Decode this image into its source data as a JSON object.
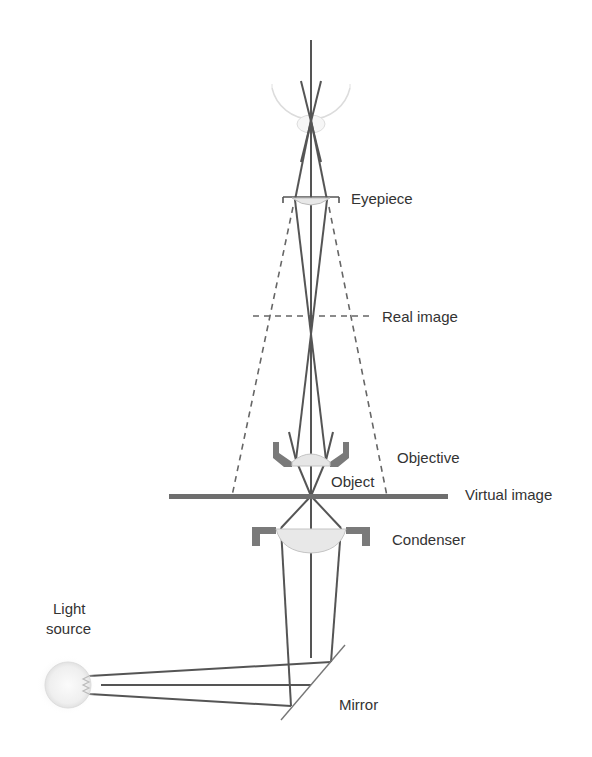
{
  "diagram": {
    "labels": {
      "eyepiece": "Eyepiece",
      "real_image": "Real image",
      "objective": "Objective",
      "object": "Object",
      "virtual_image": "Virtual image",
      "condenser": "Condenser",
      "light_source_line1": "Light",
      "light_source_line2": "source",
      "mirror": "Mirror"
    },
    "colors": {
      "ray": "#555555",
      "lens_housing": "#7a7a7a",
      "lens_glass": "#e6e6e6",
      "stage": "#6e6e6e",
      "text": "#333333"
    }
  }
}
